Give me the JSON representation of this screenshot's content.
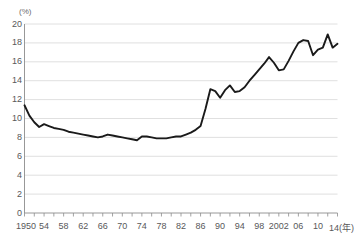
{
  "chart_data": {
    "type": "line",
    "title": "",
    "subtitle": "",
    "xlabel": "年",
    "ylabel": "(%)",
    "unit_label": "(%)",
    "xlim": [
      1950,
      2014
    ],
    "ylim": [
      0,
      20
    ],
    "grid": true,
    "legend": "none",
    "y_ticks": [
      20,
      18,
      16,
      14,
      12,
      10,
      8,
      6,
      4,
      2,
      0
    ],
    "y_tick_labels": [
      "20",
      "18",
      "16",
      "14",
      "12",
      "10",
      "8",
      "6",
      "4",
      "2",
      "0"
    ],
    "x_tick_years": [
      1950,
      1954,
      1958,
      1962,
      1966,
      1970,
      1974,
      1978,
      1982,
      1986,
      1990,
      1994,
      1998,
      2002,
      2006,
      2010,
      2014
    ],
    "x_tick_labels": [
      "1950",
      "54",
      "58",
      "62",
      "66",
      "70",
      "74",
      "78",
      "82",
      "86",
      "90",
      "94",
      "98",
      "2002",
      "06",
      "10",
      "14"
    ],
    "x_axis_suffix": "(年)",
    "minor_tick_interval_years": 2,
    "line_color": "#1a1a1a",
    "grid_color": "#d8d8d8",
    "axis_color": "#8c8c8c",
    "series": [
      {
        "name": "",
        "x": [
          1950,
          1951,
          1952,
          1953,
          1954,
          1955,
          1956,
          1957,
          1958,
          1959,
          1960,
          1961,
          1962,
          1963,
          1964,
          1965,
          1966,
          1967,
          1968,
          1969,
          1970,
          1971,
          1972,
          1973,
          1974,
          1975,
          1976,
          1977,
          1978,
          1979,
          1980,
          1981,
          1982,
          1983,
          1984,
          1985,
          1986,
          1987,
          1988,
          1989,
          1990,
          1991,
          1992,
          1993,
          1994,
          1995,
          1996,
          1997,
          1998,
          1999,
          2000,
          2001,
          2002,
          2003,
          2004,
          2005,
          2006,
          2007,
          2008,
          2009,
          2010,
          2011,
          2012,
          2013,
          2014
        ],
        "values": [
          11.4,
          10.3,
          9.6,
          9.1,
          9.4,
          9.2,
          9.0,
          8.9,
          8.8,
          8.6,
          8.5,
          8.4,
          8.3,
          8.2,
          8.1,
          8.0,
          8.1,
          8.3,
          8.2,
          8.1,
          8.0,
          7.9,
          7.8,
          7.7,
          8.1,
          8.1,
          8.0,
          7.9,
          7.9,
          7.9,
          8.0,
          8.1,
          8.1,
          8.3,
          8.5,
          8.8,
          9.2,
          11.0,
          13.1,
          12.9,
          12.2,
          13.0,
          13.5,
          12.8,
          12.9,
          13.3,
          14.0,
          14.6,
          15.2,
          15.8,
          16.5,
          15.9,
          15.1,
          15.2,
          16.1,
          17.1,
          18.0,
          18.3,
          18.2,
          16.7,
          17.3,
          17.5,
          18.9,
          17.5,
          17.9
        ]
      }
    ]
  }
}
